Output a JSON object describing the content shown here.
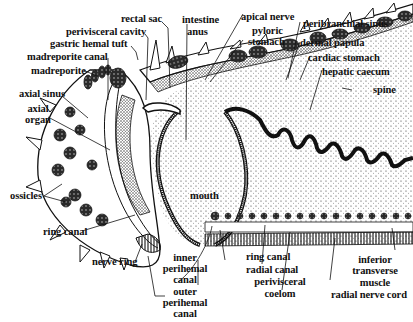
{
  "figure": {
    "labels": {
      "rectal_sac": "rectal sac",
      "intestine": "intestine",
      "anus": "anus",
      "apical_nerve": "apical nerve",
      "perivisceral_cavity": "perivisceral cavity",
      "pyloric_stomach_1": "pyloric",
      "pyloric_stomach_2": "stomach",
      "peribranchial_sinus": "peribranchial sinus",
      "gastric_hemal_tuft": "gastric hemal tuft",
      "dermal_papula": "dermal papula",
      "madreporite_canal": "madreporite canal",
      "cardiac_stomach": "cardiac stomach",
      "madreporite": "madreporite",
      "hepatic_caecum": "hepatic caecum",
      "axial_sinus": "axial sinus",
      "spine": "spine",
      "axial_organ_1": "axial",
      "axial_organ_2": "organ",
      "ossicles": "ossicles",
      "mouth": "mouth",
      "ring_canal_left": "ring canal",
      "nerve_ring": "nerve ring",
      "inner_perihemal_1": "inner",
      "inner_perihemal_2": "perihemal",
      "inner_perihemal_3": "canal",
      "outer_perihemal_1": "outer",
      "outer_perihemal_2": "perihemal",
      "outer_perihemal_3": "canal",
      "ring_canal_right": "ring canal",
      "radial_canal": "radial canal",
      "perivisceral_coelom_1": "perivisceral",
      "perivisceral_coelom_2": "coelom",
      "inferior_transverse_1": "inferior",
      "inferior_transverse_2": "transverse",
      "inferior_transverse_3": "muscle",
      "radial_nerve_cord": "radial nerve cord"
    }
  }
}
